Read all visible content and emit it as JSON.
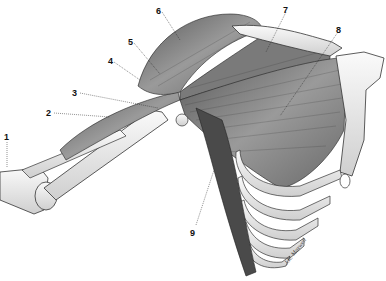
{
  "figure": {
    "labels": [
      {
        "num": "1",
        "x": 4,
        "y": 133
      },
      {
        "num": "2",
        "x": 46,
        "y": 109
      },
      {
        "num": "3",
        "x": 72,
        "y": 89
      },
      {
        "num": "4",
        "x": 108,
        "y": 57
      },
      {
        "num": "5",
        "x": 128,
        "y": 38
      },
      {
        "num": "6",
        "x": 156,
        "y": 7
      },
      {
        "num": "7",
        "x": 283,
        "y": 6
      },
      {
        "num": "8",
        "x": 336,
        "y": 26
      },
      {
        "num": "9",
        "x": 190,
        "y": 229
      }
    ],
    "signature": "J.K. Maxwell"
  },
  "colors": {
    "background": "#ffffff",
    "muscle": "#8a8a8a",
    "muscle_dark": "#3a3a3a",
    "bone": "#efefef",
    "outline": "#333333"
  }
}
